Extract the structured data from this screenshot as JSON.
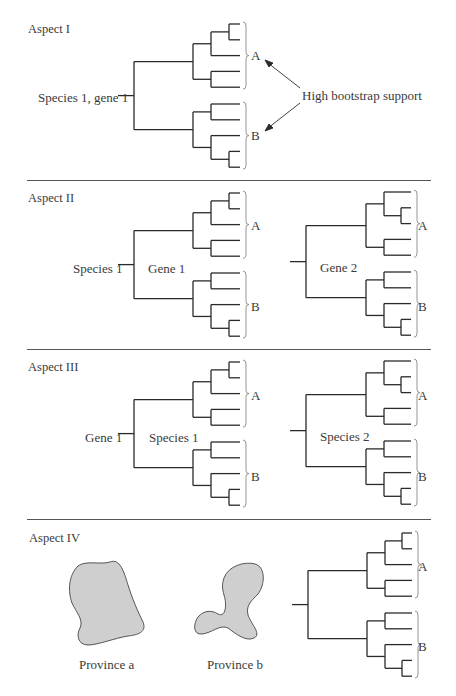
{
  "figure": {
    "colors": {
      "line": "#2a2a2a",
      "bracket": "#888888",
      "province_fill": "#cfcfcf",
      "province_stroke": "#555555",
      "separator": "#555555"
    },
    "separators_y": [
      180,
      349,
      519
    ],
    "clades": {
      "a": "A",
      "b": "B"
    },
    "panels": [
      {
        "id": "aspect-1",
        "title": "Aspect I",
        "root_label": "Species 1, gene 1",
        "annotation": "High bootstrap support",
        "trees": [
          {
            "id": "species1-gene1",
            "inner_label": ""
          }
        ]
      },
      {
        "id": "aspect-2",
        "title": "Aspect II",
        "root_label": "Species 1",
        "trees": [
          {
            "id": "gene1",
            "inner_label": "Gene 1"
          },
          {
            "id": "gene2",
            "inner_label": "Gene 2"
          }
        ]
      },
      {
        "id": "aspect-3",
        "title": "Aspect III",
        "root_label": "Gene 1",
        "trees": [
          {
            "id": "species1",
            "inner_label": "Species 1"
          },
          {
            "id": "species2",
            "inner_label": "Species 2"
          }
        ]
      },
      {
        "id": "aspect-4",
        "title": "Aspect IV",
        "provinces": [
          {
            "id": "province-a",
            "label": "Province a"
          },
          {
            "id": "province-b",
            "label": "Province b"
          }
        ],
        "trees": [
          {
            "id": "province-tree",
            "inner_label": ""
          }
        ]
      }
    ]
  }
}
